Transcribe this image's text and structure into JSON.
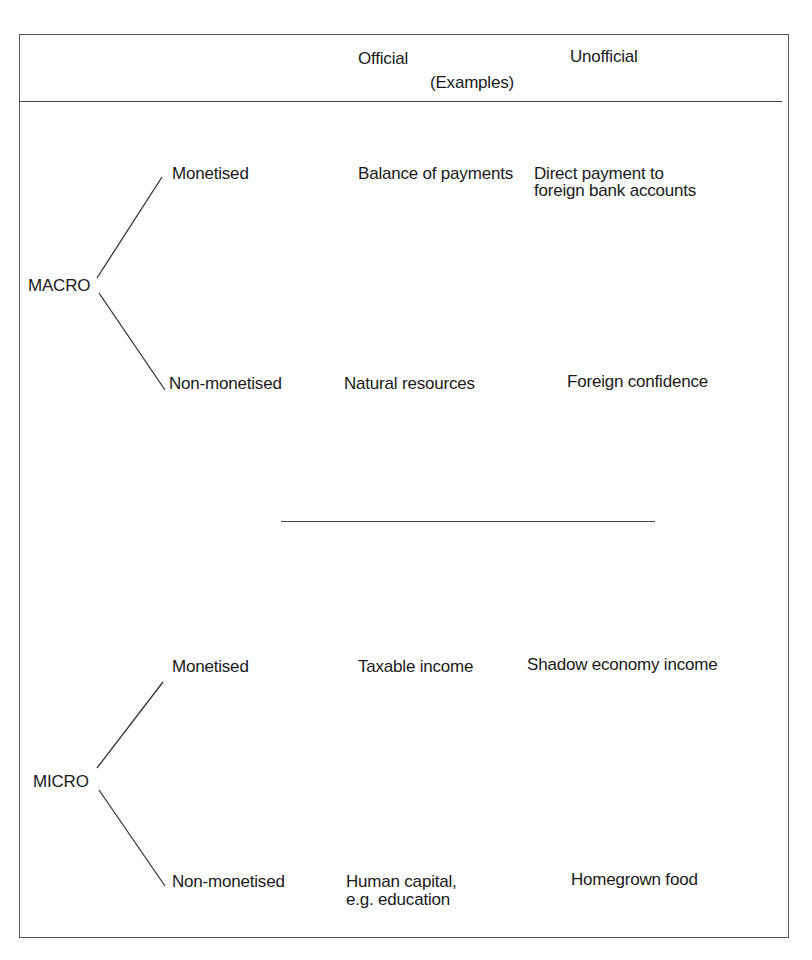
{
  "header": {
    "col_official": "Official",
    "col_unofficial": "Unofficial",
    "examples_label": "(Examples)"
  },
  "sections": [
    {
      "name": "MACRO",
      "rows": [
        {
          "type": "Monetised",
          "official": "Balance of payments",
          "unofficial_line1": "Direct payment to",
          "unofficial_line2": "foreign bank accounts"
        },
        {
          "type": "Non-monetised",
          "official": "Natural resources",
          "unofficial_line1": "Foreign confidence"
        }
      ]
    },
    {
      "name": "MICRO",
      "rows": [
        {
          "type": "Monetised",
          "official": "Taxable income",
          "unofficial_line1": "Shadow economy income"
        },
        {
          "type": "Non-monetised",
          "official_line1": "Human capital,",
          "official_line2": "e.g. education",
          "unofficial_line1": "Homegrown food"
        }
      ]
    }
  ]
}
